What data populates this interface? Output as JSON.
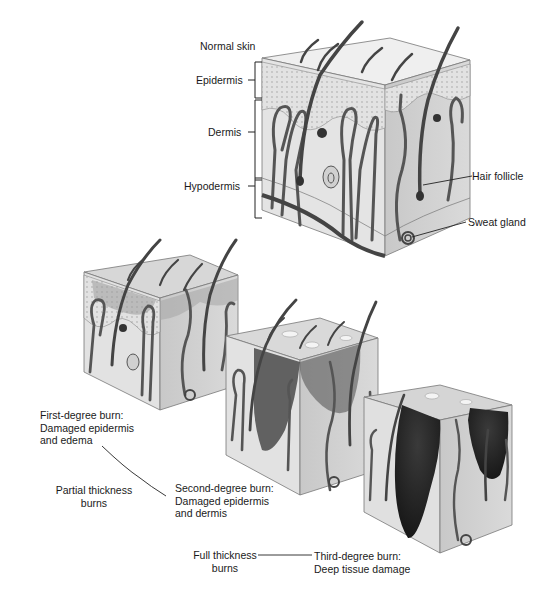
{
  "title": "Normal skin",
  "layers": {
    "epidermis": "Epidermis",
    "dermis": "Dermis",
    "hypodermis": "Hypodermis"
  },
  "structures": {
    "hair_follicle": "Hair follicle",
    "sweat_gland": "Sweat gland"
  },
  "burns": {
    "first_degree": {
      "line1": "First-degree burn:",
      "line2": "Damaged epidermis",
      "line3": "and edema"
    },
    "second_degree": {
      "line1": "Second-degree burn:",
      "line2": "Damaged epidermis",
      "line3": "and dermis"
    },
    "third_degree": {
      "line1": "Third-degree burn:",
      "line2": "Deep tissue damage"
    }
  },
  "groups": {
    "partial": {
      "line1": "Partial thickness",
      "line2": "burns"
    },
    "full": {
      "line1": "Full thickness",
      "line2": "burns"
    }
  },
  "colors": {
    "ink": "#1a1a1a",
    "skin_light": "#e6e6e6",
    "skin_side": "#cfcfcf",
    "vessel": "#555555",
    "burn_dark": "#2a2a2a"
  }
}
